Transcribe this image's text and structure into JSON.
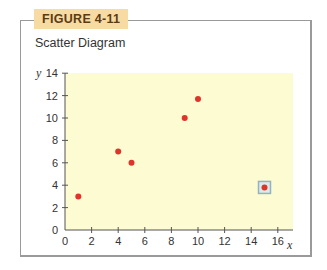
{
  "figure": {
    "label": "FIGURE 4-11",
    "title": "Scatter Diagram"
  },
  "colors": {
    "label_bg": "#f6dba3",
    "label_text": "#5c3b14",
    "plot_bg": "#fdfbd2",
    "point": "#e0332b",
    "highlight_border": "#8fb4c8",
    "frame_border": "#9a9a9a"
  },
  "chart_data": {
    "type": "scatter",
    "title": "Scatter Diagram",
    "xlabel": "x",
    "ylabel": "y",
    "xlim": [
      0,
      16
    ],
    "ylim": [
      0,
      14
    ],
    "x_ticks": [
      0,
      2,
      4,
      6,
      8,
      10,
      12,
      14,
      16
    ],
    "y_ticks": [
      0,
      2,
      4,
      6,
      8,
      10,
      12,
      14
    ],
    "grid": false,
    "points": [
      {
        "x": 1,
        "y": 3
      },
      {
        "x": 4,
        "y": 7
      },
      {
        "x": 5,
        "y": 6
      },
      {
        "x": 9,
        "y": 10
      },
      {
        "x": 10,
        "y": 11.7
      },
      {
        "x": 15,
        "y": 3.8,
        "highlighted": true
      }
    ],
    "annotations": [
      "Point (15, 3.8) highlighted with a square outline (outlier)"
    ]
  }
}
